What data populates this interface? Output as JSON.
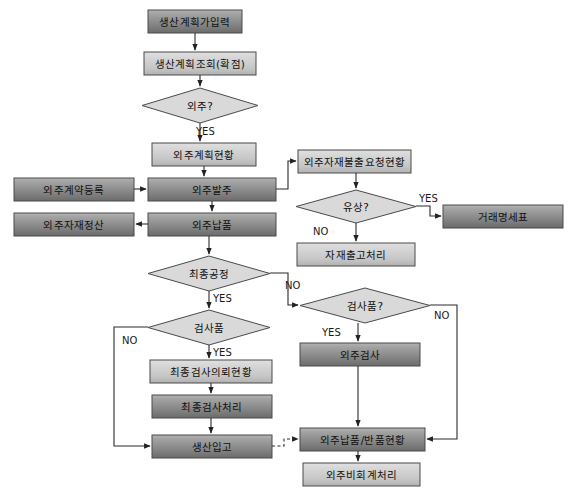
{
  "diagram": {
    "type": "flowchart",
    "canvas": {
      "width": 575,
      "height": 500
    },
    "colors": {
      "box_dark_top": "#a9a9a9",
      "box_dark_bottom": "#6e6e6e",
      "box_light_top": "#d8d8d8",
      "box_light_bottom": "#b4b4b4",
      "diamond_fill": "#d9d9d9",
      "stroke": "#4a4a4a",
      "line": "#2b2b2b",
      "text": "#101010",
      "background": "#ffffff"
    },
    "nodes": [
      {
        "id": "n1",
        "label": "생산계획가입력",
        "shape": "process",
        "tone": "dark",
        "x": 148,
        "y": 10,
        "w": 94,
        "h": 23
      },
      {
        "id": "n2",
        "label": "생산계획조회(확점)",
        "shape": "process",
        "tone": "light",
        "x": 144,
        "y": 52,
        "w": 112,
        "h": 23
      },
      {
        "id": "n3",
        "label": "외주?",
        "shape": "decision",
        "tone": "diamond",
        "x": 142,
        "y": 88,
        "w": 116,
        "h": 35
      },
      {
        "id": "n4",
        "label": "외주계획현황",
        "shape": "process",
        "tone": "light",
        "x": 152,
        "y": 143,
        "w": 104,
        "h": 23
      },
      {
        "id": "n5",
        "label": "외주계약등록",
        "shape": "process",
        "tone": "dark",
        "x": 14,
        "y": 178,
        "w": 120,
        "h": 23
      },
      {
        "id": "n6",
        "label": "외주발주",
        "shape": "process",
        "tone": "dark",
        "x": 148,
        "y": 178,
        "w": 128,
        "h": 23
      },
      {
        "id": "n7",
        "label": "외주자재정산",
        "shape": "process",
        "tone": "dark",
        "x": 14,
        "y": 213,
        "w": 120,
        "h": 23
      },
      {
        "id": "n8",
        "label": "외주납품",
        "shape": "process",
        "tone": "dark",
        "x": 148,
        "y": 213,
        "w": 128,
        "h": 23
      },
      {
        "id": "n9",
        "label": "외주자재불출요청현황",
        "shape": "process",
        "tone": "light",
        "x": 298,
        "y": 150,
        "w": 113,
        "h": 23
      },
      {
        "id": "n10",
        "label": "유상?",
        "shape": "decision",
        "tone": "diamond",
        "x": 296,
        "y": 190,
        "w": 120,
        "h": 33
      },
      {
        "id": "n11",
        "label": "거래명세표",
        "shape": "process",
        "tone": "dark",
        "x": 443,
        "y": 205,
        "w": 120,
        "h": 23
      },
      {
        "id": "n12",
        "label": "자재출고처리",
        "shape": "process",
        "tone": "light",
        "x": 297,
        "y": 243,
        "w": 118,
        "h": 23
      },
      {
        "id": "n13",
        "label": "최종공정",
        "shape": "decision",
        "tone": "diamond",
        "x": 148,
        "y": 256,
        "w": 122,
        "h": 35
      },
      {
        "id": "n14",
        "label": "검사품",
        "shape": "decision",
        "tone": "diamond",
        "x": 148,
        "y": 310,
        "w": 122,
        "h": 35
      },
      {
        "id": "n15",
        "label": "검사품?",
        "shape": "decision",
        "tone": "diamond",
        "x": 300,
        "y": 288,
        "w": 130,
        "h": 35
      },
      {
        "id": "n16",
        "label": "외주검사",
        "shape": "process",
        "tone": "dark",
        "x": 300,
        "y": 343,
        "w": 120,
        "h": 23
      },
      {
        "id": "n17",
        "label": "최종검사의뢰현황",
        "shape": "process",
        "tone": "light",
        "x": 150,
        "y": 360,
        "w": 122,
        "h": 23
      },
      {
        "id": "n18",
        "label": "최종검사처리",
        "shape": "process",
        "tone": "dark",
        "x": 152,
        "y": 395,
        "w": 120,
        "h": 23
      },
      {
        "id": "n19",
        "label": "생산입고",
        "shape": "process",
        "tone": "dark",
        "x": 152,
        "y": 435,
        "w": 120,
        "h": 23
      },
      {
        "id": "n20",
        "label": "외주납품/반품현황",
        "shape": "process",
        "tone": "dark",
        "x": 300,
        "y": 428,
        "w": 125,
        "h": 23
      },
      {
        "id": "n21",
        "label": "외주비회계처리",
        "shape": "process",
        "tone": "light",
        "x": 303,
        "y": 463,
        "w": 117,
        "h": 23
      }
    ],
    "edge_labels": [
      {
        "id": "e1",
        "text": "YES",
        "x": 196,
        "y": 126
      },
      {
        "id": "e2",
        "text": "YES",
        "x": 419,
        "y": 193
      },
      {
        "id": "e3",
        "text": "NO",
        "x": 313,
        "y": 226
      },
      {
        "id": "e4",
        "text": "YES",
        "x": 213,
        "y": 293
      },
      {
        "id": "e5",
        "text": "NO",
        "x": 285,
        "y": 280
      },
      {
        "id": "e6",
        "text": "NO",
        "x": 122,
        "y": 335
      },
      {
        "id": "e7",
        "text": "YES",
        "x": 213,
        "y": 347
      },
      {
        "id": "e8",
        "text": "YES",
        "x": 322,
        "y": 327
      },
      {
        "id": "e9",
        "text": "NO",
        "x": 434,
        "y": 310
      }
    ]
  }
}
